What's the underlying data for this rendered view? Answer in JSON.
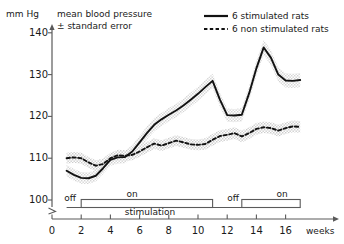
{
  "chart_data": {
    "type": "line",
    "title": "mean blood pressure\n± standard error",
    "title_line1": "mean blood pressure",
    "title_line2": "± standard error",
    "ylabel": "mm Hg",
    "xlabel": "weeks",
    "xlim": [
      0,
      17.6
    ],
    "ylim": [
      99,
      142
    ],
    "yticks": [
      100,
      110,
      120,
      130,
      140
    ],
    "ytick_labels": [
      "100",
      "110",
      "120",
      "130",
      "140"
    ],
    "xticks": [
      0,
      2,
      4,
      6,
      8,
      10,
      12,
      14,
      16
    ],
    "xtick_labels": [
      "0",
      "2",
      "4",
      "6",
      "8",
      "10",
      "12",
      "14",
      "16"
    ],
    "grid": false,
    "axis_break": true,
    "legend_position": "top-right",
    "error_band": "standard error (shaded)",
    "series": [
      {
        "name": "6 stimulated rats",
        "style": "solid",
        "x": [
          1.0,
          1.5,
          2.0,
          2.5,
          3.0,
          3.5,
          4.0,
          4.5,
          5.0,
          5.5,
          6.0,
          6.5,
          7.0,
          7.5,
          8.0,
          8.5,
          9.0,
          9.5,
          10.0,
          10.5,
          11.0,
          11.5,
          12.0,
          12.5,
          13.0,
          13.5,
          14.0,
          14.5,
          15.0,
          15.5,
          16.0,
          16.5,
          17.0
        ],
        "values": [
          107.0,
          106.0,
          105.3,
          105.2,
          105.8,
          107.6,
          109.6,
          110.2,
          110.3,
          111.6,
          113.8,
          116.0,
          118.0,
          119.3,
          120.4,
          121.4,
          122.6,
          124.0,
          125.4,
          127.0,
          128.5,
          124.0,
          120.3,
          120.2,
          120.4,
          125.5,
          131.5,
          136.5,
          134.0,
          130.0,
          128.6,
          128.5,
          128.7
        ],
        "err": [
          1.4,
          1.4,
          1.4,
          1.4,
          1.4,
          1.4,
          1.4,
          1.5,
          1.5,
          1.5,
          1.6,
          1.6,
          1.6,
          1.6,
          1.6,
          1.6,
          1.6,
          1.7,
          1.7,
          1.7,
          1.7,
          1.7,
          1.6,
          1.6,
          1.6,
          1.7,
          1.8,
          1.8,
          1.8,
          1.7,
          1.7,
          1.7,
          1.7
        ]
      },
      {
        "name": "6 non stimulated rats",
        "style": "dashed",
        "x": [
          1.0,
          1.5,
          2.0,
          2.5,
          3.0,
          3.5,
          4.0,
          4.5,
          5.0,
          5.5,
          6.0,
          6.5,
          7.0,
          7.5,
          8.0,
          8.5,
          9.0,
          9.5,
          10.0,
          10.5,
          11.0,
          11.5,
          12.0,
          12.5,
          13.0,
          13.5,
          14.0,
          14.5,
          15.0,
          15.5,
          16.0,
          16.5,
          17.0
        ],
        "values": [
          110.0,
          110.2,
          110.0,
          109.0,
          108.2,
          108.6,
          110.0,
          110.7,
          110.6,
          110.8,
          111.6,
          112.6,
          113.5,
          113.0,
          113.6,
          114.2,
          113.8,
          113.3,
          113.2,
          113.4,
          114.4,
          115.3,
          115.6,
          116.0,
          115.2,
          116.0,
          117.0,
          117.4,
          117.2,
          116.6,
          117.2,
          117.6,
          117.5
        ],
        "err": [
          1.3,
          1.3,
          1.3,
          1.3,
          1.3,
          1.3,
          1.3,
          1.3,
          1.3,
          1.3,
          1.3,
          1.3,
          1.3,
          1.3,
          1.3,
          1.3,
          1.3,
          1.3,
          1.3,
          1.4,
          1.4,
          1.4,
          1.4,
          1.4,
          1.4,
          1.4,
          1.4,
          1.4,
          1.4,
          1.4,
          1.4,
          1.4,
          1.4
        ]
      }
    ],
    "annotations": {
      "stimulation_label": "stimulation",
      "segments": [
        {
          "label": "off",
          "start": 1.0,
          "end": 2.0,
          "boxed": false
        },
        {
          "label": "on",
          "start": 2.0,
          "end": 11.0,
          "boxed": true
        },
        {
          "label": "off",
          "start": 11.0,
          "end": 13.0,
          "boxed": false
        },
        {
          "label": "on",
          "start": 13.0,
          "end": 17.0,
          "boxed": true
        }
      ]
    },
    "colors": {
      "line": "#121212",
      "band": "#c9c9c9",
      "axis": "#5a5a5a",
      "text": "#1a1a1a",
      "background": "#ffffff"
    }
  },
  "legend": {
    "items": [
      {
        "label": "6 stimulated rats",
        "style": "solid"
      },
      {
        "label": "6 non stimulated rats",
        "style": "dashed"
      }
    ]
  }
}
